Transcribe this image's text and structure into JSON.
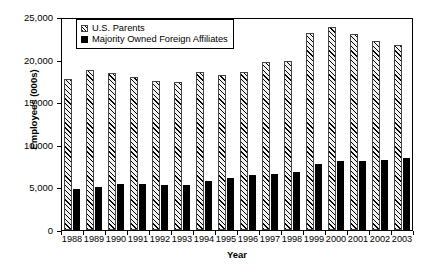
{
  "chart_data": {
    "type": "bar",
    "title": "",
    "xlabel": "Year",
    "ylabel": "Employees (000s)",
    "categories": [
      "1988",
      "1989",
      "1990",
      "1991",
      "1992",
      "1993",
      "1994",
      "1995",
      "1996",
      "1997",
      "1998",
      "1999",
      "2000",
      "2001",
      "2002",
      "2003"
    ],
    "series": [
      {
        "name": "U.S. Parents",
        "values": [
          17700,
          18800,
          18400,
          17950,
          17450,
          17400,
          18550,
          18150,
          18600,
          19750,
          19800,
          23100,
          23800,
          22950,
          22150,
          21700
        ]
      },
      {
        "name": "Majority Owned Foreign  Affiliates",
        "values": [
          4800,
          5050,
          5400,
          5350,
          5300,
          5250,
          5700,
          6100,
          6400,
          6550,
          6850,
          7750,
          8150,
          8150,
          8250,
          8500
        ]
      }
    ],
    "ylim": [
      0,
      25000
    ],
    "ytick_labels": [
      "25,000",
      "20,000",
      "15,000",
      "10,000",
      "5,000",
      "0"
    ],
    "ytick_values": [
      25000,
      20000,
      15000,
      10000,
      5000,
      0
    ],
    "grid": false,
    "legend_position": "top-left",
    "colors": {
      "parents": "#f2f2f2",
      "affiliates": "#000000",
      "axis": "#000000",
      "background": "#ffffff"
    }
  },
  "legend": {
    "items": [
      {
        "label": "U.S. Parents",
        "marker": "hatched-square-swatch"
      },
      {
        "label": "Majority Owned Foreign  Affiliates",
        "marker": "filled-square-swatch"
      }
    ]
  }
}
